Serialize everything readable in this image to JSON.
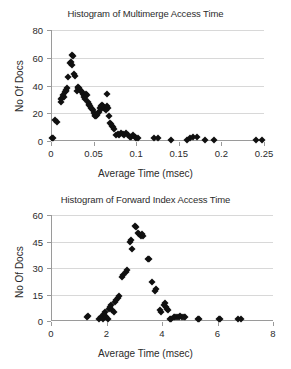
{
  "chart_data": [
    {
      "type": "scatter",
      "id": "multimerge",
      "title": "Histogram of Multimerge Access Time",
      "xlabel": "Average Time (msec)",
      "ylabel": "No Of Docs",
      "xlim": [
        0,
        0.25
      ],
      "ylim": [
        0,
        80
      ],
      "xticks": [
        0,
        0.05,
        0.1,
        0.15,
        0.2,
        0.25
      ],
      "xtick_labels": [
        "0",
        "0.05",
        "0.1",
        "0.15",
        "0.2",
        "0.25"
      ],
      "yticks": [
        0,
        20,
        40,
        60,
        80
      ],
      "ytick_labels": [
        "0",
        "20",
        "40",
        "60",
        "80"
      ],
      "grid": "horizontal",
      "marker": "diamond",
      "marker_color": "#101010",
      "points": [
        [
          0.0,
          2
        ],
        [
          0.001,
          2
        ],
        [
          0.004,
          15
        ],
        [
          0.006,
          14
        ],
        [
          0.01,
          28
        ],
        [
          0.011,
          30
        ],
        [
          0.012,
          31
        ],
        [
          0.013,
          33
        ],
        [
          0.014,
          32
        ],
        [
          0.015,
          35
        ],
        [
          0.016,
          36
        ],
        [
          0.017,
          37
        ],
        [
          0.018,
          38
        ],
        [
          0.019,
          46
        ],
        [
          0.021,
          56
        ],
        [
          0.022,
          57
        ],
        [
          0.023,
          55
        ],
        [
          0.024,
          62
        ],
        [
          0.025,
          61
        ],
        [
          0.026,
          48
        ],
        [
          0.027,
          47
        ],
        [
          0.029,
          36
        ],
        [
          0.03,
          38
        ],
        [
          0.031,
          39
        ],
        [
          0.032,
          38
        ],
        [
          0.033,
          37
        ],
        [
          0.034,
          36
        ],
        [
          0.035,
          35
        ],
        [
          0.036,
          34
        ],
        [
          0.037,
          33
        ],
        [
          0.038,
          32
        ],
        [
          0.039,
          30
        ],
        [
          0.04,
          34
        ],
        [
          0.041,
          33
        ],
        [
          0.042,
          28
        ],
        [
          0.043,
          27
        ],
        [
          0.044,
          26
        ],
        [
          0.045,
          25
        ],
        [
          0.046,
          24
        ],
        [
          0.047,
          23
        ],
        [
          0.048,
          22
        ],
        [
          0.049,
          20
        ],
        [
          0.05,
          19
        ],
        [
          0.051,
          18
        ],
        [
          0.052,
          18
        ],
        [
          0.053,
          19
        ],
        [
          0.054,
          20
        ],
        [
          0.055,
          21
        ],
        [
          0.056,
          24
        ],
        [
          0.057,
          25
        ],
        [
          0.058,
          23
        ],
        [
          0.059,
          26
        ],
        [
          0.06,
          25
        ],
        [
          0.061,
          24
        ],
        [
          0.062,
          23
        ],
        [
          0.063,
          22
        ],
        [
          0.064,
          34
        ],
        [
          0.065,
          25
        ],
        [
          0.066,
          24
        ],
        [
          0.067,
          18
        ],
        [
          0.068,
          13
        ],
        [
          0.069,
          12
        ],
        [
          0.07,
          11
        ],
        [
          0.072,
          10
        ],
        [
          0.073,
          9
        ],
        [
          0.075,
          4
        ],
        [
          0.077,
          5
        ],
        [
          0.079,
          4
        ],
        [
          0.081,
          6
        ],
        [
          0.083,
          5
        ],
        [
          0.085,
          4
        ],
        [
          0.087,
          6
        ],
        [
          0.089,
          4
        ],
        [
          0.091,
          3
        ],
        [
          0.093,
          3
        ],
        [
          0.095,
          4
        ],
        [
          0.097,
          3
        ],
        [
          0.099,
          2
        ],
        [
          0.101,
          2
        ],
        [
          0.12,
          2
        ],
        [
          0.124,
          2
        ],
        [
          0.14,
          1
        ],
        [
          0.158,
          1
        ],
        [
          0.162,
          2
        ],
        [
          0.166,
          3
        ],
        [
          0.17,
          3
        ],
        [
          0.18,
          1
        ],
        [
          0.19,
          1
        ],
        [
          0.24,
          1
        ],
        [
          0.246,
          1
        ]
      ]
    },
    {
      "type": "scatter",
      "id": "forward",
      "title": "Histogram of Forward Index Access Time",
      "xlabel": "Average Time (msec)",
      "ylabel": "No Of Docs",
      "xlim": [
        0,
        8
      ],
      "ylim": [
        0,
        60
      ],
      "xticks": [
        0,
        2,
        4,
        6,
        8
      ],
      "xtick_labels": [
        "0",
        "2",
        "4",
        "6",
        "8"
      ],
      "yticks": [
        0,
        15,
        30,
        45,
        60
      ],
      "ytick_labels": [
        "0",
        "15",
        "30",
        "45",
        "60"
      ],
      "grid": "horizontal",
      "marker": "diamond",
      "marker_color": "#101010",
      "points": [
        [
          1.25,
          2
        ],
        [
          1.3,
          3
        ],
        [
          1.7,
          1
        ],
        [
          1.78,
          2
        ],
        [
          1.82,
          1
        ],
        [
          1.86,
          4
        ],
        [
          1.9,
          5
        ],
        [
          1.92,
          3
        ],
        [
          1.96,
          2
        ],
        [
          2.0,
          1
        ],
        [
          2.05,
          7
        ],
        [
          2.1,
          8
        ],
        [
          2.14,
          9
        ],
        [
          2.18,
          6
        ],
        [
          2.22,
          5
        ],
        [
          2.28,
          11
        ],
        [
          2.32,
          12
        ],
        [
          2.38,
          13
        ],
        [
          2.42,
          14
        ],
        [
          2.52,
          25
        ],
        [
          2.56,
          26
        ],
        [
          2.66,
          28
        ],
        [
          2.7,
          29
        ],
        [
          2.8,
          45
        ],
        [
          2.84,
          46
        ],
        [
          2.9,
          41
        ],
        [
          2.98,
          54
        ],
        [
          3.02,
          53
        ],
        [
          3.1,
          50
        ],
        [
          3.14,
          49
        ],
        [
          3.2,
          48
        ],
        [
          3.24,
          49
        ],
        [
          3.28,
          48
        ],
        [
          3.45,
          35
        ],
        [
          3.5,
          35
        ],
        [
          3.62,
          22
        ],
        [
          3.72,
          17
        ],
        [
          3.76,
          18
        ],
        [
          3.88,
          6
        ],
        [
          3.92,
          5
        ],
        [
          4.02,
          9
        ],
        [
          4.06,
          10
        ],
        [
          4.1,
          8
        ],
        [
          4.14,
          7
        ],
        [
          4.18,
          6
        ],
        [
          4.24,
          1
        ],
        [
          4.3,
          1
        ],
        [
          4.38,
          2
        ],
        [
          4.44,
          2
        ],
        [
          4.5,
          2
        ],
        [
          4.56,
          2
        ],
        [
          4.62,
          3
        ],
        [
          4.68,
          2
        ],
        [
          4.74,
          2
        ],
        [
          4.8,
          2
        ],
        [
          5.25,
          1
        ],
        [
          5.3,
          1
        ],
        [
          6.0,
          1
        ],
        [
          6.06,
          1
        ],
        [
          6.72,
          1
        ],
        [
          6.82,
          1
        ]
      ]
    }
  ]
}
